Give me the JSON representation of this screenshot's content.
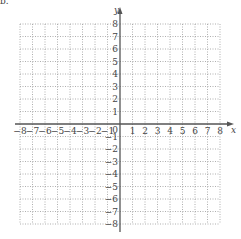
{
  "corner_label": "b.",
  "chart_data": {
    "type": "coordinate-grid",
    "title": "",
    "xlabel": "x",
    "ylabel": "y",
    "xlim": [
      -8,
      8
    ],
    "ylim": [
      -8,
      8
    ],
    "grid": true,
    "grid_style": "dotted",
    "x_ticks": [
      -8,
      -7,
      -6,
      -5,
      -4,
      -3,
      -2,
      -1,
      0,
      1,
      2,
      3,
      4,
      5,
      6,
      7,
      8
    ],
    "y_ticks": [
      -8,
      -7,
      -6,
      -5,
      -4,
      -3,
      -2,
      -1,
      1,
      2,
      3,
      4,
      5,
      6,
      7,
      8
    ],
    "x_tick_labels": [
      "−8",
      "−7",
      "−6",
      "−5",
      "−4",
      "−3",
      "−2",
      "−1",
      "0",
      "1",
      "2",
      "3",
      "4",
      "5",
      "6",
      "7",
      "8"
    ],
    "y_tick_labels": [
      "−8",
      "−7",
      "−6",
      "−5",
      "−4",
      "−3",
      "−2",
      "−1",
      "1",
      "2",
      "3",
      "4",
      "5",
      "6",
      "7",
      "8"
    ],
    "origin_label": "0",
    "data_points": []
  },
  "colors": {
    "grid": "#9a9a9a",
    "axis": "#555555",
    "label": "#444444"
  }
}
